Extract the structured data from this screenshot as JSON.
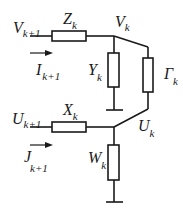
{
  "diagram": {
    "type": "circuit",
    "nodes": {
      "v_in": {
        "main": "V",
        "sub": "k+1"
      },
      "v_k": {
        "main": "V",
        "sub": "k"
      },
      "u_in": {
        "main": "U",
        "sub": "k+1"
      },
      "u_k": {
        "main": "U",
        "sub": "k"
      }
    },
    "currents": {
      "i_in": {
        "main": "I",
        "sub": "k+1"
      },
      "j_in": {
        "main": "J",
        "sub": "k+1"
      }
    },
    "components": {
      "z": {
        "main": "Z",
        "sub": "k"
      },
      "y": {
        "main": "Y",
        "sub": "k"
      },
      "gamma": {
        "main": "Γ",
        "sub": "k"
      },
      "x": {
        "main": "X",
        "sub": "k"
      },
      "w": {
        "main": "W",
        "sub": "k"
      }
    }
  }
}
